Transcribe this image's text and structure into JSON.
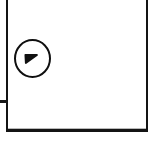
{
  "figure": {
    "title": "Scanned line-art fragment",
    "background_color": "#ffffff",
    "ink_color": "#141414",
    "width": 156,
    "height": 142
  },
  "frame": {
    "name": "outer-rectangle",
    "description": "Rectangular border, open at the top where the scan is cropped",
    "stroke_color": "#141414",
    "stroke_width": "2px",
    "bottom_stroke_width": "3px",
    "interior_fill": "#ffffff"
  },
  "artifacts": {
    "inner_bottom_line_color": "#b9b9b9",
    "edge_tick": {
      "name": "left-edge-tick",
      "description": "Short horizontal stub protruding left from the frame at mid-height",
      "color": "#171717"
    }
  },
  "callout": {
    "name": "circled-reference-marker",
    "shape": "circle",
    "stroke_color": "#0f0f0f",
    "fill_color": "#ffffff",
    "glyph": "7",
    "glyph_orientation": "rotated",
    "glyph_label": "7"
  }
}
